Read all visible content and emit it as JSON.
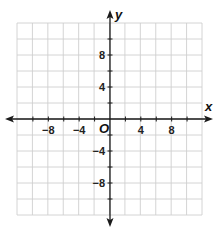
{
  "chart_data": {
    "type": "scatter",
    "title": "",
    "xlabel": "x",
    "ylabel": "y",
    "origin_label": "O",
    "xlim": [
      -12,
      12
    ],
    "ylim": [
      -12,
      12
    ],
    "grid": true,
    "grid_step": 2,
    "x_tick_labels": [
      "−8",
      "−4",
      "4",
      "8"
    ],
    "x_tick_values": [
      -8,
      -4,
      4,
      8
    ],
    "y_tick_labels": [
      "8",
      "4",
      "−4",
      "−8"
    ],
    "y_tick_values": [
      8,
      4,
      -4,
      -8
    ],
    "points": [],
    "colors": {
      "grid": "#cfcfcf",
      "axis": "#1a1a1a",
      "text": "#222222"
    }
  },
  "layout": {
    "grid_left": 17,
    "grid_right": 202,
    "grid_top": 23,
    "grid_bottom": 215,
    "origin_x": 110,
    "origin_y": 119
  }
}
